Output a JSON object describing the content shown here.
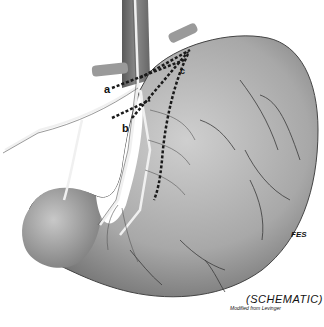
{
  "figure": {
    "labels": {
      "a": "a",
      "b": "b",
      "c": "c"
    },
    "caption": "(SCHEMATIC)",
    "credit": "Modified from Levinger",
    "signature": "FES",
    "colors": {
      "background": "#ffffff",
      "stomach_light": "#d4d4d4",
      "stomach_dark": "#6e6e6e",
      "nerve": "#e8e8e8",
      "cut_lines": "#222222",
      "esophagus": "#7a7a7a"
    }
  }
}
